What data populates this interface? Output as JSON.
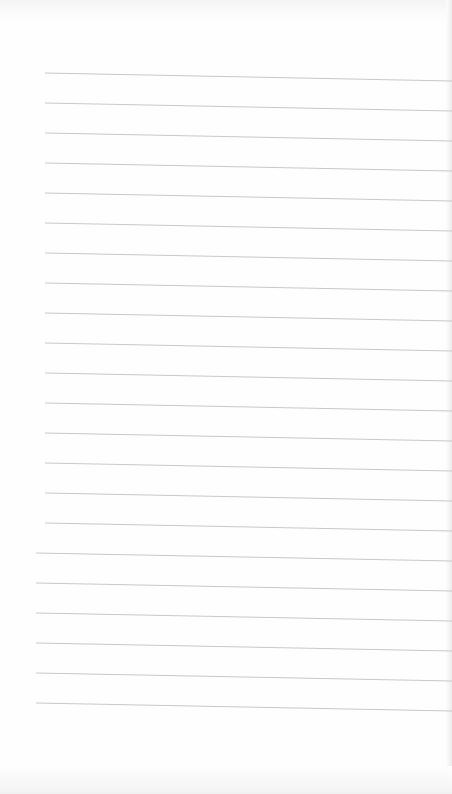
{
  "page": {
    "type": "lined-paper-scan",
    "line_count": 22,
    "line_color": "#c8c8c8",
    "paper_color": "#fefefe"
  }
}
